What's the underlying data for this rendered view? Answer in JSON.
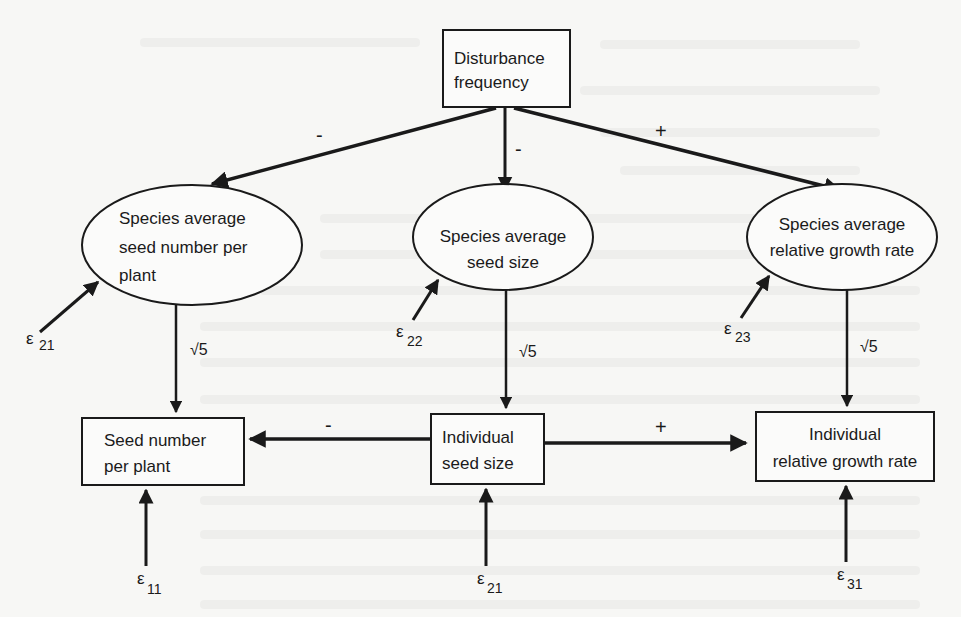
{
  "diagram": {
    "type": "path-diagram",
    "nodes": {
      "disturbance": {
        "shape": "rect",
        "lines": [
          "Disturbance",
          "frequency"
        ]
      },
      "species_seed_number": {
        "shape": "ellipse",
        "lines": [
          "Species average",
          "seed number per",
          "plant"
        ]
      },
      "species_seed_size": {
        "shape": "ellipse",
        "lines": [
          "Species average",
          "seed size"
        ]
      },
      "species_rgr": {
        "shape": "ellipse",
        "lines": [
          "Species average",
          "relative growth rate"
        ]
      },
      "seed_number": {
        "shape": "rect",
        "lines": [
          "Seed number",
          "per plant"
        ]
      },
      "individual_seed_size": {
        "shape": "rect",
        "lines": [
          "Individual",
          "seed size"
        ]
      },
      "individual_rgr": {
        "shape": "rect",
        "lines": [
          "Individual",
          "relative growth rate"
        ]
      }
    },
    "edges": [
      {
        "from": "disturbance",
        "to": "species_seed_number",
        "sign": "-"
      },
      {
        "from": "disturbance",
        "to": "species_seed_size",
        "sign": "-"
      },
      {
        "from": "disturbance",
        "to": "species_rgr",
        "sign": "+"
      },
      {
        "from": "species_seed_number",
        "to": "seed_number",
        "label": "√5"
      },
      {
        "from": "species_seed_size",
        "to": "individual_seed_size",
        "label": "√5"
      },
      {
        "from": "species_rgr",
        "to": "individual_rgr",
        "label": "√5"
      },
      {
        "from": "individual_seed_size",
        "to": "seed_number",
        "sign": "-"
      },
      {
        "from": "individual_seed_size",
        "to": "individual_rgr",
        "sign": "+"
      }
    ],
    "errors": [
      {
        "symbol": "ε",
        "subscript": "21",
        "to": "species_seed_number"
      },
      {
        "symbol": "ε",
        "subscript": "22",
        "to": "species_seed_size"
      },
      {
        "symbol": "ε",
        "subscript": "23",
        "to": "species_rgr"
      },
      {
        "symbol": "ε",
        "subscript": "11",
        "to": "seed_number"
      },
      {
        "symbol": "ε",
        "subscript": "21",
        "to": "individual_seed_size"
      },
      {
        "symbol": "ε",
        "subscript": "31",
        "to": "individual_rgr"
      }
    ],
    "colors": {
      "ink": "#1a1a1a",
      "background": "#f7f7f5"
    }
  }
}
